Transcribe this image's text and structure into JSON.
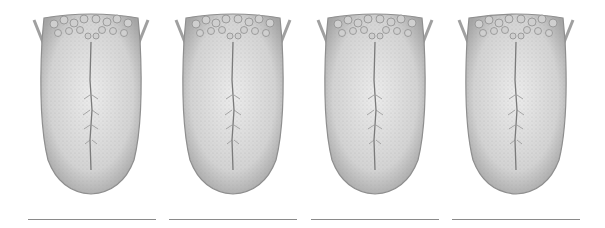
{
  "figure": {
    "panels": [
      {
        "index": 1,
        "subject": "tongue",
        "caption": ""
      },
      {
        "index": 2,
        "subject": "tongue",
        "caption": ""
      },
      {
        "index": 3,
        "subject": "tongue",
        "caption": ""
      },
      {
        "index": 4,
        "subject": "tongue",
        "caption": ""
      }
    ],
    "colors": {
      "background": "#ffffff",
      "tongue_fill": "#d9d9d9",
      "tongue_shade": "#9a9a9a",
      "papillae": "#bdbdbd",
      "line": "#8a8a8a"
    }
  }
}
